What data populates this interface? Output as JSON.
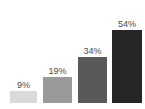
{
  "chart_data": {
    "type": "bar",
    "title": "",
    "subtitle": "",
    "xlabel": "",
    "ylabel": "",
    "categories": [
      "",
      "",
      "",
      ""
    ],
    "values": [
      9,
      19,
      34,
      54
    ],
    "data_labels": [
      "9%",
      "19%",
      "34%",
      "54%"
    ],
    "ylim": [
      0,
      60
    ],
    "grid": false,
    "legend": false,
    "label_position": "above-bar",
    "series": [
      {
        "name": "",
        "values": [
          9,
          19,
          34,
          54
        ]
      }
    ],
    "bar_colors": [
      "#d9d9d9",
      "#9a9a9a",
      "#595959",
      "#262626"
    ],
    "label_color": "#4a4a4a",
    "background_color": "#ffffff"
  }
}
